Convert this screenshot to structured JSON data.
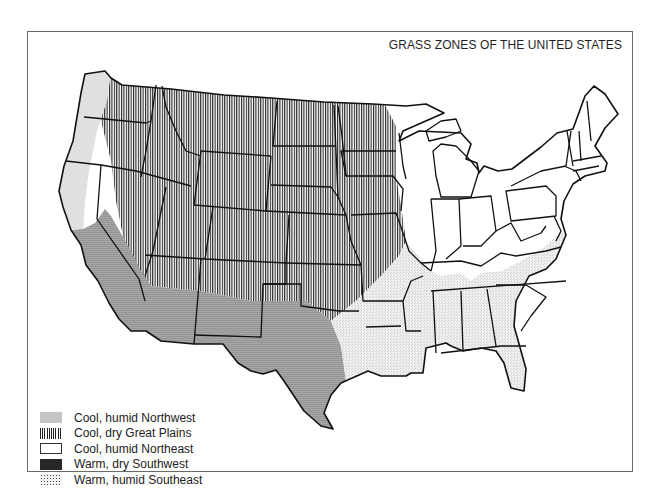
{
  "map": {
    "title": "GRASS ZONES OF THE UNITED STATES",
    "legend": [
      {
        "key": "cool_humid_northwest",
        "label": "Cool, humid Northwest",
        "pattern": "fine-dots-light"
      },
      {
        "key": "cool_dry_great_plains",
        "label": "Cool, dry Great Plains",
        "pattern": "vertical-lines"
      },
      {
        "key": "cool_humid_northeast",
        "label": "Cool, humid Northeast",
        "pattern": "blank"
      },
      {
        "key": "warm_dry_southwest",
        "label": "Warm, dry Southwest",
        "pattern": "dense-dots"
      },
      {
        "key": "warm_humid_southeast",
        "label": "Warm, humid Southeast",
        "pattern": "sparse-stipple"
      }
    ],
    "colors": {
      "border": "#111111",
      "frame": "#6a6a6a",
      "background": "#ffffff"
    }
  }
}
